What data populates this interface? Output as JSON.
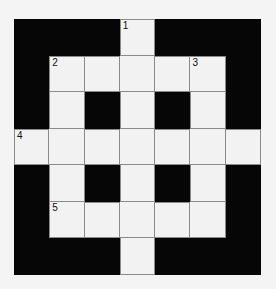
{
  "puzzle": {
    "type": "crossword",
    "rows": 7,
    "cols": 7,
    "layout": [
      "BBBWBBB",
      "BWWWWWB",
      "BWBWBWB",
      "WWWWWWW",
      "BWBWBWB",
      "BWWWWWB",
      "BBBWBBB"
    ],
    "numbers": [
      {
        "row": 0,
        "col": 3,
        "label": "1"
      },
      {
        "row": 1,
        "col": 1,
        "label": "2"
      },
      {
        "row": 1,
        "col": 5,
        "label": "3"
      },
      {
        "row": 3,
        "col": 0,
        "label": "4"
      },
      {
        "row": 5,
        "col": 1,
        "label": "5"
      }
    ],
    "colors": {
      "black": "#060606",
      "white": "#f2f2f2",
      "line": "#8a8a8a"
    }
  }
}
